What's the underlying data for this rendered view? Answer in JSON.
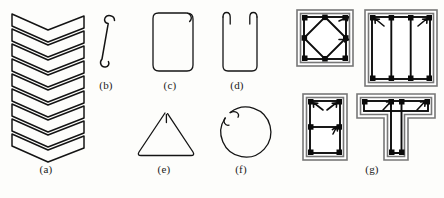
{
  "figure": {
    "background_color": "#fdfdfb",
    "line_color": "#141414",
    "section_outline_color": "#777777",
    "width": 444,
    "height": 198
  },
  "panels": [
    {
      "key": "a",
      "caption": "(a)",
      "name": "continuous-zigzag-stirrup",
      "description": "Continuous zigzag / lacing bar reinforcement formed by a single bent bar",
      "repeat_count": 9,
      "caption_x": 46,
      "caption_y": 170
    },
    {
      "key": "b",
      "caption": "(b)",
      "name": "single-crosstie-hook",
      "description": "Single crosstie bar with hooks at both ends",
      "caption_x": 106,
      "caption_y": 86
    },
    {
      "key": "c",
      "caption": "(c)",
      "name": "closed-rectangular-hoop",
      "description": "Closed rectangular hoop with 135 degree seismic hook at one corner",
      "caption_x": 170,
      "caption_y": 86
    },
    {
      "key": "d",
      "caption": "(d)",
      "name": "open-u-stirrup",
      "description": "Open U-shaped stirrup with two hooked legs at the top",
      "caption_x": 237,
      "caption_y": 86
    },
    {
      "key": "e",
      "caption": "(e)",
      "name": "triangular-stirrup",
      "description": "Triangular closed stirrup with hook at apex",
      "caption_x": 164,
      "caption_y": 170
    },
    {
      "key": "f",
      "caption": "(f)",
      "name": "circular-spiral-hoop",
      "description": "Circular hoop or spiral with overlapping hooked end",
      "caption_x": 241,
      "caption_y": 170
    },
    {
      "key": "g",
      "caption": "(g)",
      "name": "column-section-group",
      "description": "Four reinforced concrete cross sections showing tie and crosstie arrangements",
      "caption_x": 372,
      "caption_y": 170,
      "sections": [
        {
          "name": "square-section-diamond-tie",
          "shape": "square",
          "bar_count": 8,
          "tie_pattern": "diamond inner tie plus perimeter hoop"
        },
        {
          "name": "rectangular-section-multi-leg-tie",
          "shape": "rectangle",
          "bar_count": 6,
          "tie_pattern": "perimeter hoop with two interior crosstie legs"
        },
        {
          "name": "tall-rectangular-section-crosstie",
          "shape": "tall-rectangle",
          "bar_count": 6,
          "tie_pattern": "perimeter hoop with one horizontal crosstie"
        },
        {
          "name": "tee-section-ties",
          "shape": "tee",
          "bar_count": 6,
          "tie_pattern": "flange hoop with web stirrup"
        }
      ]
    }
  ]
}
